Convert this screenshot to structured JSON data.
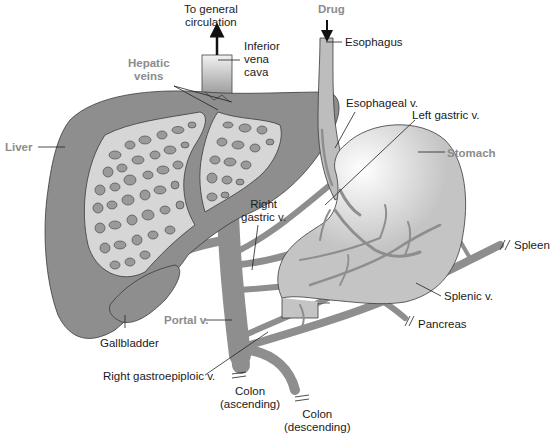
{
  "diagram": {
    "colors": {
      "organ_fill": "#8e8e8e",
      "vein_fill": "#8e8e8e",
      "stomach_fill": "#c4c4c4",
      "esophagus_fill": "#bdbdbd",
      "liver_sinusoid_fill": "#d6d6d6",
      "outline": "#3a3a3a",
      "label_text": "#1a1a1a",
      "highlight_label_text": "#8c8c8c",
      "background": "#ffffff"
    },
    "labels": {
      "to_general_circulation_1": "To general",
      "to_general_circulation_2": "circulation",
      "inferior_vena_cava_1": "Inferior",
      "inferior_vena_cava_2": "vena",
      "inferior_vena_cava_3": "cava",
      "drug": "Drug",
      "esophagus": "Esophagus",
      "hepatic_veins_1": "Hepatic",
      "hepatic_veins_2": "veins",
      "esophageal_v": "Esophageal v.",
      "left_gastric_v": "Left gastric v.",
      "liver": "Liver",
      "stomach": "Stomach",
      "right_gastric_v_1": "Right",
      "right_gastric_v_2": "gastric v.",
      "spleen": "Spleen",
      "splenic_v": "Splenic v.",
      "portal_v": "Portal v.",
      "gallbladder": "Gallbladder",
      "pancreas": "Pancreas",
      "right_gastroepiploic_v": "Right gastroepiploic v.",
      "colon_ascending_1": "Colon",
      "colon_ascending_2": "(ascending)",
      "colon_descending_1": "Colon",
      "colon_descending_2": "(descending)"
    },
    "highlighted_labels": [
      "Drug",
      "Hepatic veins",
      "Liver",
      "Stomach",
      "Portal v."
    ]
  }
}
